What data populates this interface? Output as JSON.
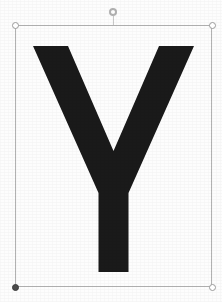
{
  "canvas": {
    "width": 222,
    "height": 302,
    "background_color": "#fdfdfd",
    "description": "Scanned black capital letter Y shown as a selected object"
  },
  "selection": {
    "box_label": "selection-bounding-box",
    "border_color": "#b3b3b3",
    "left": 15,
    "top": 25,
    "width": 197,
    "height": 262,
    "handles": [
      {
        "name": "top-left",
        "state": "inactive",
        "fill": "#ffffff",
        "border": "#9a9a9a",
        "x": 15,
        "y": 25
      },
      {
        "name": "top-right",
        "state": "inactive",
        "fill": "#ffffff",
        "border": "#9a9a9a",
        "x": 212,
        "y": 25
      },
      {
        "name": "bottom-left",
        "state": "active",
        "fill": "#4a4a4a",
        "border": "#3a3a3a",
        "x": 15,
        "y": 287
      },
      {
        "name": "bottom-right",
        "state": "inactive",
        "fill": "#ffffff",
        "border": "#9a9a9a",
        "x": 212,
        "y": 287
      }
    ],
    "rotation_handle": {
      "name": "rotation-handle",
      "fill": "#ffffff",
      "border": "#b0b0b0",
      "x": 113,
      "y": 12
    }
  },
  "artwork": {
    "name": "letter-y-glyph",
    "character": "Y",
    "fill_color": "#1a1a1a",
    "style": "bold sans-serif capital, flat horizontal arm tops, square stem foot",
    "path": "M 18 21 L 53 21 L 98.5 126 L 144 21 L 179 21 L 113.5 168 L 113.5 247 L 83.5 247 L 83.5 168 Z"
  }
}
